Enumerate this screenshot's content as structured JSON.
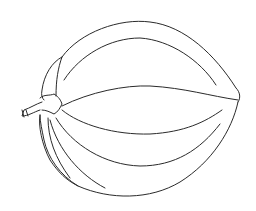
{
  "image": {
    "subject": "line drawing of a ribbed gourd / pumpkin with stem",
    "caption": "Line-art sketch of a ribbed gourd",
    "colors": {
      "background": "#ffffff",
      "stroke": "#2a2a2a"
    }
  }
}
